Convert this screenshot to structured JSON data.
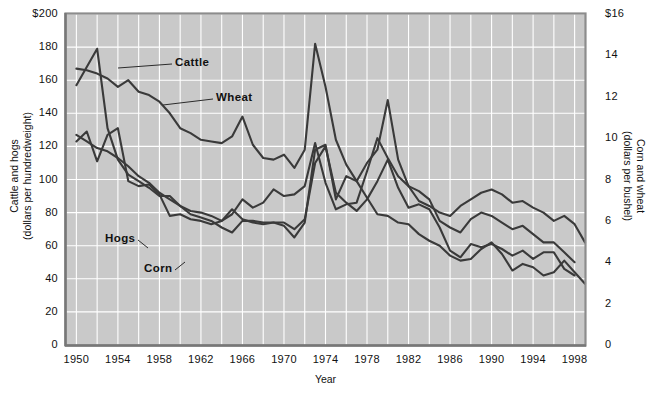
{
  "chart_data": {
    "type": "line",
    "title": "",
    "xlabel": "Year",
    "ylabel_left": "Cattle and hogs\n(dollars per hundredweight)",
    "ylabel_right": "Corn and wheat\n(dollars per bushel)",
    "grid": true,
    "legend_position": "inline-callouts",
    "xlim": [
      1949,
      1999
    ],
    "xticks": [
      1950,
      1954,
      1958,
      1962,
      1966,
      1970,
      1974,
      1978,
      1982,
      1986,
      1990,
      1994,
      1998
    ],
    "xtick_labels": [
      "1950",
      "1954",
      "1958",
      "1962",
      "1966",
      "1970",
      "1974",
      "1978",
      "1982",
      "1986",
      "1990",
      "1994",
      "1998"
    ],
    "x_minor_gridlines": [
      1952,
      1956,
      1960,
      1964,
      1968,
      1972,
      1976,
      1980,
      1984,
      1988,
      1992,
      1996
    ],
    "ylim_left": [
      0,
      200
    ],
    "yticks_left": [
      0,
      20,
      40,
      60,
      80,
      100,
      120,
      140,
      160,
      180,
      200
    ],
    "ytick_labels_left": [
      "0",
      "20",
      "40",
      "60",
      "80",
      "100",
      "120",
      "140",
      "160",
      "180",
      "$200"
    ],
    "ylim_right": [
      0,
      16
    ],
    "yticks_right": [
      0,
      2,
      4,
      6,
      8,
      10,
      12,
      14,
      16
    ],
    "ytick_labels_right": [
      "0",
      "2",
      "4",
      "6",
      "8",
      "10",
      "12",
      "14",
      "$16"
    ],
    "years": [
      1950,
      1951,
      1952,
      1953,
      1954,
      1955,
      1956,
      1957,
      1958,
      1959,
      1960,
      1961,
      1962,
      1963,
      1964,
      1965,
      1966,
      1967,
      1968,
      1969,
      1970,
      1971,
      1972,
      1973,
      1974,
      1975,
      1976,
      1977,
      1978,
      1979,
      1980,
      1981,
      1982,
      1983,
      1984,
      1985,
      1986,
      1987,
      1988,
      1989,
      1990,
      1991,
      1992,
      1993,
      1994,
      1995,
      1996,
      1997,
      1998,
      1999
    ],
    "series": [
      {
        "name": "Cattle",
        "axis": "left",
        "unit": "dollars per hundredweight",
        "color": "#3a3a3a",
        "values": [
          157,
          168,
          179,
          131,
          112,
          103,
          99,
          95,
          90,
          90,
          84,
          81,
          80,
          78,
          75,
          79,
          88,
          83,
          86,
          94,
          90,
          91,
          96,
          122,
          98,
          82,
          85,
          86,
          105,
          125,
          113,
          102,
          96,
          87,
          84,
          80,
          78,
          84,
          88,
          92,
          94,
          91,
          86,
          87,
          83,
          80,
          75,
          78,
          73,
          62
        ]
      },
      {
        "name": "Wheat",
        "axis": "right",
        "unit": "dollars per bushel",
        "color": "#3a3a3a",
        "values": [
          167,
          166,
          164,
          161,
          156,
          160,
          153,
          151,
          147,
          140,
          131,
          128,
          124,
          123,
          122,
          126,
          138,
          121,
          113,
          112,
          115,
          107,
          118,
          182,
          156,
          124,
          109,
          99,
          110,
          118,
          148,
          112,
          96,
          93,
          88,
          75,
          71,
          68,
          76,
          80,
          78,
          74,
          70,
          72,
          67,
          62,
          62,
          56,
          50,
          null
        ]
      },
      {
        "name": "Hogs",
        "axis": "left",
        "unit": "dollars per hundredweight",
        "color": "#3a3a3a",
        "values": [
          123,
          129,
          111,
          127,
          131,
          99,
          96,
          97,
          91,
          78,
          79,
          76,
          75,
          73,
          75,
          82,
          76,
          74,
          73,
          74,
          72,
          65,
          74,
          118,
          121,
          88,
          102,
          99,
          89,
          79,
          78,
          74,
          73,
          67,
          63,
          60,
          54,
          51,
          52,
          58,
          62,
          55,
          45,
          49,
          47,
          42,
          44,
          51,
          44,
          37
        ]
      },
      {
        "name": "Corn",
        "axis": "right",
        "unit": "dollars per bushel",
        "color": "#3a3a3a",
        "values": [
          127,
          123,
          119,
          117,
          113,
          108,
          102,
          98,
          92,
          88,
          84,
          79,
          77,
          75,
          71,
          68,
          75,
          75,
          74,
          74,
          74,
          70,
          76,
          110,
          120,
          92,
          86,
          81,
          88,
          99,
          112,
          95,
          83,
          85,
          82,
          71,
          57,
          53,
          61,
          59,
          61,
          58,
          54,
          57,
          52,
          56,
          56,
          46,
          42,
          null
        ]
      }
    ],
    "annotations": [
      {
        "text": "Cattle",
        "series": "Cattle"
      },
      {
        "text": "Wheat",
        "series": "Wheat"
      },
      {
        "text": "Hogs",
        "series": "Hogs"
      },
      {
        "text": "Corn",
        "series": "Corn"
      }
    ]
  },
  "plot_style": {
    "plot_bg": "#c9c9c9",
    "gridline_color": "#ffffff",
    "line_color": "#3a3a3a",
    "text_color": "#111111",
    "page_bg": "#ffffff"
  }
}
